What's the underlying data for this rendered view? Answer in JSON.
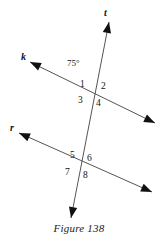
{
  "figure": {
    "caption": "Figure 138",
    "background_color": "#ffffff",
    "line_color": "#555555",
    "text_color": "#111111",
    "lines": [
      {
        "name": "t",
        "label": "t",
        "label_x": 104,
        "label_y": 8,
        "x1": 109,
        "y1": 22,
        "x2": 71,
        "y2": 218,
        "arrow_start": true,
        "arrow_end": true
      },
      {
        "name": "k",
        "label": "k",
        "label_x": 21,
        "label_y": 52,
        "x1": 30,
        "y1": 62,
        "x2": 155,
        "y2": 123,
        "arrow_start": true,
        "arrow_end": true
      },
      {
        "name": "r",
        "label": "r",
        "label_x": 10,
        "label_y": 123,
        "x1": 19,
        "y1": 133,
        "x2": 152,
        "y2": 192,
        "arrow_start": true,
        "arrow_end": true
      }
    ],
    "intersections": [
      {
        "name": "upper",
        "x": 92,
        "y": 93,
        "lines": [
          "t",
          "k"
        ]
      },
      {
        "name": "lower",
        "x": 79,
        "y": 165,
        "lines": [
          "t",
          "r"
        ]
      }
    ],
    "angle_labels": [
      {
        "id": "1",
        "text": "1",
        "x": 80,
        "y": 80
      },
      {
        "id": "2",
        "text": "2",
        "x": 101,
        "y": 82
      },
      {
        "id": "3",
        "text": "3",
        "x": 78,
        "y": 96
      },
      {
        "id": "4",
        "text": "4",
        "x": 96,
        "y": 99
      },
      {
        "id": "5",
        "text": "5",
        "x": 70,
        "y": 151
      },
      {
        "id": "6",
        "text": "6",
        "x": 87,
        "y": 154
      },
      {
        "id": "7",
        "text": "7",
        "x": 65,
        "y": 168
      },
      {
        "id": "8",
        "text": "8",
        "x": 83,
        "y": 171
      }
    ],
    "angle_measures": [
      {
        "id": "angle-75",
        "text": "75°",
        "x": 67,
        "y": 59
      }
    ]
  }
}
